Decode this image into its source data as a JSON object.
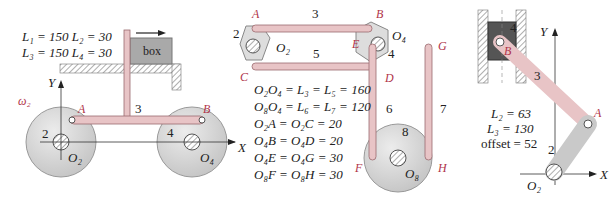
{
  "colors": {
    "link": "#e8c4c6",
    "link_stroke": "#9a6a6e",
    "disk": "#d8d8d8",
    "disk_stroke": "#8a8a8a",
    "label_red": "#b0344a",
    "text": "#222222"
  },
  "fig1": {
    "params_line1": "L₁ = 150  L₂ = 30",
    "params_line2": "L₃ = 150  L₄ = 30",
    "box_label": "box",
    "y_axis": "Y",
    "x_axis": "X",
    "omega": "ω₂",
    "points": {
      "A": "A",
      "B": "B"
    },
    "links": {
      "l2": "2",
      "l3": "3",
      "l4": "4"
    },
    "pivots": {
      "O2": "O₂",
      "O4": "O₄"
    }
  },
  "fig2": {
    "points": {
      "A": "A",
      "B": "B",
      "C": "C",
      "D": "D",
      "E": "E",
      "F": "F",
      "G": "G",
      "H": "H"
    },
    "links": {
      "l2": "2",
      "l3": "3",
      "l4": "4",
      "l5": "5",
      "l6": "6",
      "l7": "7",
      "l8": "8"
    },
    "pivots": {
      "O2": "O₂",
      "O4": "O₄",
      "O8": "O₈"
    },
    "equations": [
      "O₂O₄ = L₃ = L₅ = 160",
      "O₈O₄ = L₆ = L₇ = 120",
      "O₂A = O₂C = 20",
      "O₄B = O₄D = 20",
      "O₄E = O₄G = 30",
      "O₈F = O₈H = 30"
    ]
  },
  "fig3": {
    "params": [
      "L₂ = 63",
      "L₃ = 130",
      "offset = 52"
    ],
    "points": {
      "A": "A",
      "B": "B"
    },
    "links": {
      "l2": "2",
      "l3": "3",
      "l4": "4"
    },
    "pivots": {
      "O2": "O₂"
    },
    "y_axis": "Y",
    "x_axis": "X"
  }
}
